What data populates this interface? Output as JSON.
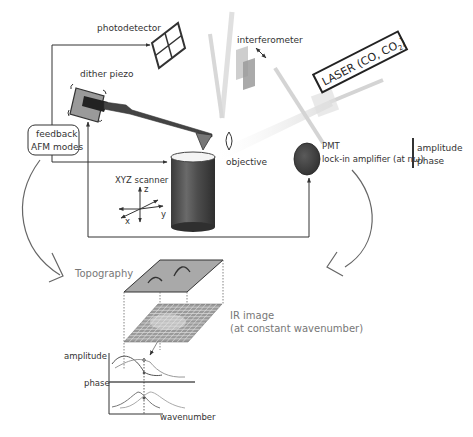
{
  "labels": {
    "photodetector": "photodetector",
    "interferometer": "interferometer",
    "dither_piezo": "dither piezo",
    "feedback_line1": "feedback",
    "feedback_line2": "AFM modes",
    "laser": "LASER (CO, CO",
    "laser_sub": "2",
    "laser_close": ")",
    "objective": "objective",
    "pmt": "PMT",
    "lockin": "lock-in amplifier (at nω)",
    "amplitude_out": "amplitude",
    "phase_out": "phase",
    "xyz_scanner": "XYZ scanner",
    "axis_x": "x",
    "axis_y": "y",
    "axis_z": "z",
    "topography": "Topography",
    "ir_image_line1": "IR image",
    "ir_image_line2": "(at constant wavenumber)",
    "spectrum_amplitude": "amplitude",
    "spectrum_phase": "phase",
    "spectrum_xlabel": "wavenumber"
  },
  "colors": {
    "line": "#333333",
    "label": "#333333",
    "label_gray": "#777777",
    "beam": "#c8c8c8",
    "scanner": "#555555",
    "pmt": "#4a4a4a",
    "topo_plane": "#a9a9a9",
    "ir_grid": "#8a8a8a"
  }
}
